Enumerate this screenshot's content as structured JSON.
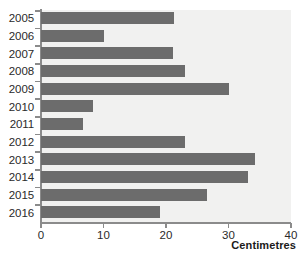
{
  "chart_data": {
    "type": "bar",
    "orientation": "horizontal",
    "title": "",
    "xlabel": "Centimetres",
    "ylabel": "",
    "xlim": [
      0,
      40
    ],
    "xticks": [
      0,
      10,
      20,
      30,
      40
    ],
    "grid": false,
    "legend": null,
    "categories": [
      "2005",
      "2006",
      "2007",
      "2008",
      "2009",
      "2010",
      "2011",
      "2012",
      "2013",
      "2014",
      "2015",
      "2016"
    ],
    "values": [
      21.3,
      10.0,
      21.1,
      23.0,
      30.1,
      8.3,
      6.7,
      23.0,
      34.2,
      33.1,
      26.6,
      19.0
    ],
    "bar_color": "#6c6c6c",
    "plot_background": "#f1f1f0",
    "axis_color": "#8b8b8b"
  }
}
